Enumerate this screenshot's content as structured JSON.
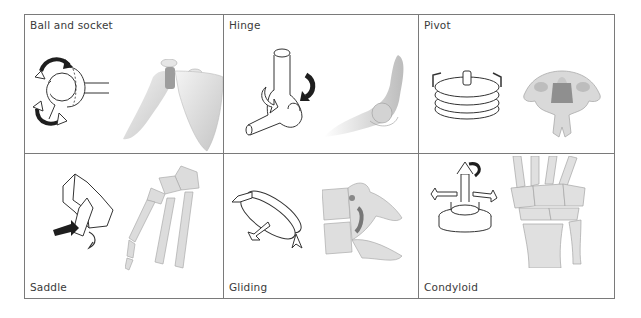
{
  "figure": {
    "joints": [
      {
        "name": "Ball and socket",
        "label_position": "top",
        "model": "ball-and-socket-model",
        "anatomy": "shoulder-joint"
      },
      {
        "name": "Hinge",
        "label_position": "top",
        "model": "hinge-model",
        "anatomy": "elbow-joint"
      },
      {
        "name": "Pivot",
        "label_position": "top",
        "model": "pivot-model",
        "anatomy": "cervical-vertebra"
      },
      {
        "name": "Saddle",
        "label_position": "bottom",
        "model": "saddle-model",
        "anatomy": "thumb-carpometacarpal-joint"
      },
      {
        "name": "Gliding",
        "label_position": "bottom",
        "model": "gliding-model",
        "anatomy": "intervertebral-facet-joint"
      },
      {
        "name": "Condyloid",
        "label_position": "bottom",
        "model": "condyloid-model",
        "anatomy": "wrist-joint"
      }
    ]
  },
  "colors": {
    "grid_line": "#7a7a7a",
    "label_text": "#3a3a3a",
    "bone_fill": "#e4e4e4",
    "bone_shade": "#b9b9b9",
    "arrow_dark": "#1e1e1e",
    "outline": "#333333"
  }
}
